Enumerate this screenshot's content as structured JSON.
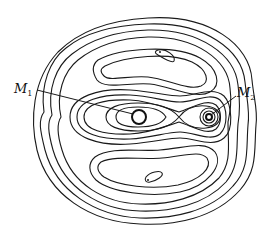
{
  "figure": {
    "type": "contour-diagram",
    "labels": {
      "m1": {
        "base": "M",
        "subscript": "1"
      },
      "m2": {
        "base": "M",
        "subscript": "2"
      }
    },
    "stroke_color": "#1a1a1a",
    "background_color": "#ffffff"
  }
}
